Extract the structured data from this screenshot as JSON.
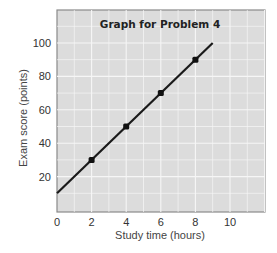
{
  "chart_data": {
    "type": "line",
    "title": "Graph for Problem 4",
    "xlabel": "Study time (hours)",
    "ylabel": "Exam score (points)",
    "xlim": [
      0,
      12
    ],
    "ylim": [
      0,
      120
    ],
    "x_ticks": [
      "0",
      "2",
      "4",
      "6",
      "8",
      "10"
    ],
    "y_ticks": [
      "20",
      "40",
      "60",
      "80",
      "100"
    ],
    "grid": true,
    "line": {
      "x": [
        0,
        9
      ],
      "y": [
        10,
        100
      ],
      "equation": "y = 10 + 10x"
    },
    "series": [
      {
        "name": "points",
        "x": [
          2,
          4,
          6,
          8
        ],
        "y": [
          30,
          50,
          70,
          90
        ]
      }
    ],
    "colors": {
      "plot_bg": "#dcdcdc",
      "grid": "#f4f4f4",
      "line": "#1a1a1a",
      "border": "#888888"
    }
  }
}
